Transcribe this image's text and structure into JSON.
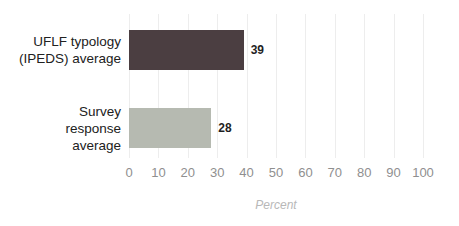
{
  "chart_data": {
    "type": "bar",
    "orientation": "horizontal",
    "title": "",
    "categories": [
      "UFLF typology (IPEDS) average",
      "Survey response average"
    ],
    "category_lines": [
      [
        "UFLF typology",
        "(IPEDS) average"
      ],
      [
        "Survey",
        "response",
        "average"
      ]
    ],
    "values": [
      39,
      28
    ],
    "value_labels": [
      "39",
      "28"
    ],
    "bar_colors": [
      "#4b3e41",
      "#b6bab1"
    ],
    "xlabel": "Percent",
    "x_ticks": [
      0,
      10,
      20,
      30,
      40,
      50,
      60,
      70,
      80,
      90,
      100
    ],
    "xlim": [
      0,
      100
    ],
    "grid": "vertical-faint",
    "legend": "none",
    "colors": {
      "gridline": "#ededed",
      "tick_text": "#8f8f8f",
      "category_text": "#212121",
      "value_text": "#1f1f1f",
      "axis_title_text": "#b8b8b8"
    }
  }
}
